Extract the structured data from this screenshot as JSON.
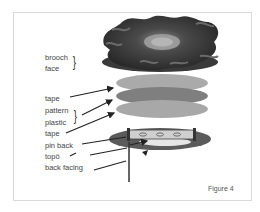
{
  "figure": {
    "caption": "Figure 4",
    "labels": {
      "brooch": "brooch",
      "face": "face",
      "tape_top": "tape",
      "pattern": "pattern",
      "plastic": "plastic",
      "tape_bottom": "tape",
      "pin_back": "pin back",
      "topo": "topö",
      "back_facing": "back facing"
    },
    "brace_glyph": "}",
    "colors": {
      "frame": "#d8d8d8",
      "tape_layer": "#a9a9a9",
      "pattern_layer": "#7d7d7d",
      "plastic_layer": "#a6a6a6",
      "back_disc": "#5a5a5a",
      "brooch_dark": "#2e2e2e",
      "arrow": "#222222"
    }
  }
}
